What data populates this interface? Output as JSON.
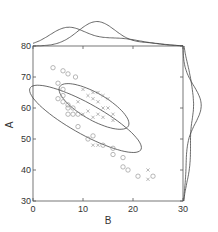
{
  "chart_data": {
    "type": "scatter",
    "title": "",
    "xlabel": "B",
    "ylabel": "A",
    "xlim": [
      0,
      30
    ],
    "ylim": [
      30,
      80
    ],
    "x_ticks": [
      0,
      10,
      20,
      30
    ],
    "y_ticks": [
      30,
      40,
      50,
      60,
      70,
      80
    ],
    "grid": false,
    "legend": null,
    "marginals": "kde on top (B) and right (A)",
    "series": [
      {
        "name": "group-circle",
        "marker": "circle",
        "color": "#9a9a9a",
        "points": [
          [
            4,
            73
          ],
          [
            6,
            72
          ],
          [
            7,
            71
          ],
          [
            5,
            68
          ],
          [
            6,
            66
          ],
          [
            5,
            63
          ],
          [
            6,
            62
          ],
          [
            7,
            61
          ],
          [
            7,
            60
          ],
          [
            8,
            60
          ],
          [
            6,
            64
          ],
          [
            7,
            58
          ],
          [
            8,
            58
          ],
          [
            9,
            54
          ],
          [
            11,
            50
          ],
          [
            12,
            51
          ],
          [
            14,
            48
          ],
          [
            16,
            47
          ],
          [
            16,
            45
          ],
          [
            18,
            44
          ],
          [
            18,
            41
          ],
          [
            19,
            40
          ],
          [
            21,
            38
          ],
          [
            24,
            38
          ],
          [
            8.5,
            70
          ],
          [
            9,
            58
          ]
        ],
        "ellipse": {
          "cx": 10.5,
          "cy": 56.5,
          "angle_deg": -44,
          "rx": 15,
          "ry": 4.2
        }
      },
      {
        "name": "group-x",
        "marker": "x",
        "color": "#9a9a9a",
        "points": [
          [
            10,
            66
          ],
          [
            11,
            64
          ],
          [
            12,
            65
          ],
          [
            12,
            63
          ],
          [
            13,
            65
          ],
          [
            13,
            62
          ],
          [
            14,
            64
          ],
          [
            14,
            60
          ],
          [
            15,
            63
          ],
          [
            11,
            59
          ],
          [
            12,
            57
          ],
          [
            13,
            58
          ],
          [
            15,
            60
          ],
          [
            16,
            58
          ],
          [
            16,
            56
          ],
          [
            14,
            57
          ],
          [
            9,
            62
          ],
          [
            10,
            58
          ],
          [
            12,
            48
          ],
          [
            13,
            48
          ],
          [
            23,
            40
          ],
          [
            23,
            37
          ]
        ],
        "ellipse": {
          "cx": 12.2,
          "cy": 60.5,
          "angle_deg": -47,
          "rx": 9.5,
          "ry": 3.6
        }
      }
    ]
  },
  "axes": {
    "x_label": "B",
    "y_label": "A",
    "x_tick_labels": [
      "0",
      "10",
      "20",
      "30"
    ],
    "y_tick_labels": [
      "30",
      "40",
      "50",
      "60",
      "70",
      "80"
    ]
  }
}
